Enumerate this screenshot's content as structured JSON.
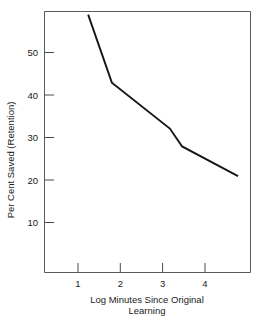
{
  "chart_data": {
    "type": "line",
    "title": "",
    "xlabel": "Log Minutes Since Original Learning",
    "xlabel_line1": "Log Minutes Since Original",
    "xlabel_line2": "Learning",
    "ylabel": "Per Cent Saved (Retention)",
    "xlim": [
      0.13,
      4.95
    ],
    "ylim": [
      3.0,
      59.5
    ],
    "xticks": [
      1,
      2,
      3,
      4
    ],
    "xtick_labels": [
      "1",
      "2",
      "3",
      "4"
    ],
    "yticks": [
      10,
      20,
      30,
      40,
      50
    ],
    "ytick_labels": [
      "10",
      "20",
      "30",
      "40",
      "50"
    ],
    "grid": false,
    "legend": "none",
    "series": [
      {
        "name": "Retention curve",
        "color": "#161616",
        "x": [
          1.24,
          1.8,
          3.17,
          3.46,
          4.78
        ],
        "y": [
          58.9,
          42.9,
          32.1,
          27.9,
          20.9
        ]
      }
    ]
  },
  "axes": {
    "y_axis_title": "Per Cent Saved (Retention)",
    "x_axis_title_line1": "Log Minutes Since Original",
    "x_axis_title_line2": "Learning"
  },
  "ticks": {
    "y": [
      "50",
      "40",
      "30",
      "20",
      "10"
    ],
    "x": [
      "1",
      "2",
      "3",
      "4"
    ]
  },
  "colors": {
    "line": "#161616",
    "frame": "#5a5a5a",
    "text": "#1a1a1a",
    "background": "#ffffff"
  }
}
